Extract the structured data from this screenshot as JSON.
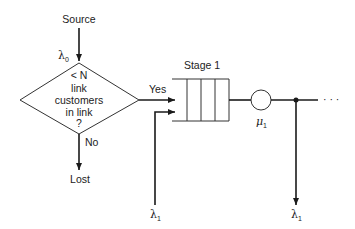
{
  "diagram": {
    "source_label": "Source",
    "arrival_rate": {
      "symbol": "λ",
      "subscript": "0"
    },
    "decision": {
      "lines": [
        "< N",
        "link",
        "customers",
        "in link",
        "?"
      ],
      "yes_label": "Yes",
      "no_label": "No"
    },
    "lost_label": "Lost",
    "stage": {
      "label": "Stage 1",
      "service_rate": {
        "symbol": "μ",
        "subscript": "1"
      }
    },
    "external_input": {
      "symbol": "λ",
      "subscript": "1"
    },
    "external_output": {
      "symbol": "λ",
      "subscript": "1"
    },
    "continuation": "· · ·",
    "colors": {
      "line": "#1a1a1a",
      "text": "#222222",
      "background": "#ffffff"
    }
  }
}
